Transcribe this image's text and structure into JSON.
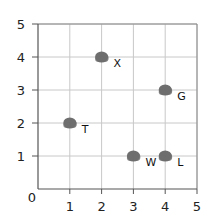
{
  "chart_data": {
    "type": "scatter",
    "title": "",
    "xlabel": "",
    "ylabel": "",
    "xlim": [
      0,
      5
    ],
    "ylim": [
      0,
      5
    ],
    "grid": true,
    "legend": "none",
    "x_ticks": [
      "1",
      "2",
      "3",
      "4",
      "5"
    ],
    "y_ticks": [
      "1",
      "2",
      "3",
      "4",
      "5"
    ],
    "origin_label": "0",
    "points": [
      {
        "label": "X",
        "x": 2,
        "y": 4
      },
      {
        "label": "G",
        "x": 4,
        "y": 3
      },
      {
        "label": "T",
        "x": 1,
        "y": 2
      },
      {
        "label": "W",
        "x": 3,
        "y": 1
      },
      {
        "label": "L",
        "x": 4,
        "y": 1
      }
    ],
    "colors": {
      "marker": "#6e6e6e",
      "grid": "#c8c8c8",
      "axis": "#555555",
      "text": "#222222"
    }
  }
}
